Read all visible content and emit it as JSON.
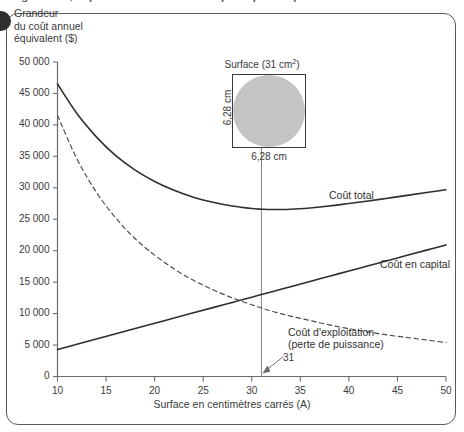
{
  "caption": {
    "text": "générale, le point minimal ne correspond pas au point de croisement."
  },
  "chart_data": {
    "type": "line",
    "title": "",
    "xlabel": "Surface en centimètres carrés (A)",
    "ylabel": "Grandeur\ndu coût annuel\néquivalent ($)",
    "xlim": [
      10,
      50
    ],
    "ylim": [
      0,
      50000
    ],
    "xticks": [
      10,
      15,
      20,
      25,
      30,
      35,
      40,
      45,
      50
    ],
    "xticklabels": [
      "10",
      "15",
      "20",
      "25",
      "30",
      "35",
      "40",
      "45",
      "50"
    ],
    "yticks": [
      0,
      5000,
      10000,
      15000,
      20000,
      25000,
      30000,
      35000,
      40000,
      45000,
      50000
    ],
    "yticklabels": [
      "0",
      "5 000",
      "10 000",
      "15 000",
      "20 000",
      "25 000",
      "30 000",
      "35 000",
      "40 000",
      "45 000",
      "50 000"
    ],
    "grid": false,
    "legend_position": "inline-labels",
    "x": [
      10,
      12,
      14,
      16,
      18,
      20,
      22,
      24,
      26,
      28,
      30,
      31,
      32,
      34,
      36,
      38,
      40,
      42,
      44,
      46,
      48,
      50
    ],
    "series": [
      {
        "name": "Coût total",
        "style": "solid",
        "color": "#2f2f2f",
        "values": [
          46500,
          41800,
          38100,
          35100,
          32800,
          31000,
          29600,
          28500,
          27700,
          27100,
          26700,
          26600,
          26550,
          26600,
          26800,
          27100,
          27500,
          27900,
          28350,
          28800,
          29250,
          29700
        ]
      },
      {
        "name": "Coût en capital",
        "style": "solid",
        "color": "#2f2f2f",
        "values": [
          4300,
          5130,
          5960,
          6790,
          7630,
          8460,
          9290,
          10120,
          10950,
          11780,
          12610,
          13030,
          13440,
          14280,
          15110,
          15940,
          16770,
          17600,
          18430,
          19260,
          20090,
          20920
        ]
      },
      {
        "name": "Coût d'exploitation (perte de puissance)",
        "style": "dashed",
        "color": "#4a4a4a",
        "values": [
          41500,
          34600,
          29300,
          25200,
          21900,
          19300,
          17100,
          15300,
          13800,
          12500,
          11400,
          10900,
          10400,
          9600,
          8900,
          8200,
          7600,
          7100,
          6600,
          6200,
          5800,
          5400
        ]
      }
    ],
    "annotations": [
      {
        "name": "intersection-marker",
        "label": "31",
        "x": 31,
        "type": "vertical-line-with-arrow"
      }
    ]
  },
  "series_labels": [
    {
      "name": "total-cost-label",
      "text": "Coût total"
    },
    {
      "name": "capital-cost-label",
      "text": "Coût en capital"
    },
    {
      "name": "operating-cost-label-line1",
      "text": "Coût d'exploitation"
    },
    {
      "name": "operating-cost-label-line2",
      "text": "(perte de puissance)"
    }
  ],
  "inset": {
    "title_prefix": "Surface (31 cm",
    "title_sup": "2",
    "title_suffix": ")",
    "label_left": "6,28 cm",
    "label_bottom": "6,28 cm",
    "shape_fill": "#c4c4c4"
  }
}
